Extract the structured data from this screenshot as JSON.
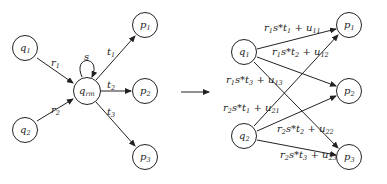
{
  "left": {
    "nodes": [
      {
        "id": "q1",
        "name": "q",
        "sub": "1",
        "x": 25,
        "y": 48
      },
      {
        "id": "q2",
        "name": "q",
        "sub": "2",
        "x": 25,
        "y": 130
      },
      {
        "id": "qrm",
        "name": "q",
        "sub": "rm",
        "x": 87,
        "y": 91
      },
      {
        "id": "p1",
        "name": "p",
        "sub": "1",
        "x": 145,
        "y": 25
      },
      {
        "id": "p2",
        "name": "p",
        "sub": "2",
        "x": 145,
        "y": 91
      },
      {
        "id": "p3",
        "name": "p",
        "sub": "3",
        "x": 145,
        "y": 157
      }
    ],
    "edges": [
      {
        "from": "q1",
        "to": "qrm",
        "label": "r",
        "sub": "1"
      },
      {
        "from": "q2",
        "to": "qrm",
        "label": "r",
        "sub": "2"
      },
      {
        "from": "qrm",
        "to": "qrm",
        "label": "s",
        "sub": ""
      },
      {
        "from": "qrm",
        "to": "p1",
        "label": "t",
        "sub": "1"
      },
      {
        "from": "qrm",
        "to": "p2",
        "label": "t",
        "sub": "2"
      },
      {
        "from": "qrm",
        "to": "p3",
        "label": "t",
        "sub": "3"
      }
    ]
  },
  "transform_arrow": "→",
  "right": {
    "nodes": [
      {
        "id": "q1",
        "name": "q",
        "sub": "1",
        "x": 244,
        "y": 52
      },
      {
        "id": "q2",
        "name": "q",
        "sub": "2",
        "x": 244,
        "y": 136
      },
      {
        "id": "p1",
        "name": "p",
        "sub": "1",
        "x": 349,
        "y": 25
      },
      {
        "id": "p2",
        "name": "p",
        "sub": "2",
        "x": 349,
        "y": 91
      },
      {
        "id": "p3",
        "name": "p",
        "sub": "3",
        "x": 349,
        "y": 157
      }
    ],
    "edges": [
      {
        "from": "q1",
        "to": "p1",
        "label": "r1s*t1 + u11"
      },
      {
        "from": "q1",
        "to": "p2",
        "label": "r1s*t2 + u12"
      },
      {
        "from": "q1",
        "to": "p3",
        "label": "r1s*t3 + u13"
      },
      {
        "from": "q2",
        "to": "p1",
        "label": "r2s*t1 + u21"
      },
      {
        "from": "q2",
        "to": "p2",
        "label": "r2s*t2 + u22"
      },
      {
        "from": "q2",
        "to": "p3",
        "label": "r2s*t3 + u23"
      }
    ]
  }
}
